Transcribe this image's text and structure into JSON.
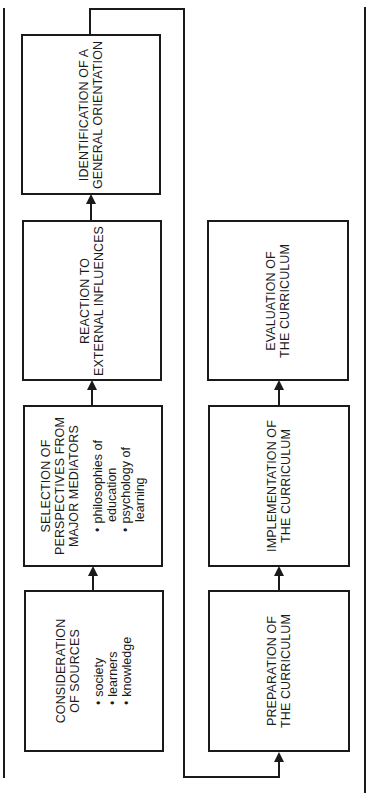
{
  "diagram": {
    "orientation": "rotated-90-ccw",
    "flow_left_column": [
      {
        "id": "consideration",
        "title_lines": [
          "CONSIDERATION",
          "OF SOURCES"
        ],
        "bullets": [
          "society",
          "learners",
          "knowledge"
        ]
      },
      {
        "id": "selection",
        "title_lines": [
          "SELECTION OF",
          "PERSPECTIVES FROM",
          "MAJOR MEDIATORS"
        ],
        "bullets": [
          "philosophies of",
          "education",
          "psychology of",
          "learning"
        ]
      },
      {
        "id": "reaction",
        "title_lines": [
          "REACTION TO",
          "EXTERNAL INFLUENCES"
        ]
      },
      {
        "id": "identification",
        "title_lines": [
          "IDENTIFICATION OF A",
          "GENERAL ORIENTATION"
        ]
      }
    ],
    "flow_right_column": [
      {
        "id": "preparation",
        "title_lines": [
          "PREPARATION OF",
          "THE CURRICULUM"
        ]
      },
      {
        "id": "implementation",
        "title_lines": [
          "IMPLEMENTATION OF",
          "THE CURRICULUM"
        ]
      },
      {
        "id": "evaluation",
        "title_lines": [
          "EVALUATION OF",
          "THE CURRICULUM"
        ]
      }
    ],
    "connections": [
      [
        "consideration",
        "selection"
      ],
      [
        "selection",
        "reaction"
      ],
      [
        "reaction",
        "identification"
      ],
      [
        "identification",
        "preparation"
      ],
      [
        "preparation",
        "implementation"
      ],
      [
        "implementation",
        "evaluation"
      ]
    ],
    "colors": {
      "stroke": "#1a1a1a",
      "background": "#ffffff"
    }
  }
}
